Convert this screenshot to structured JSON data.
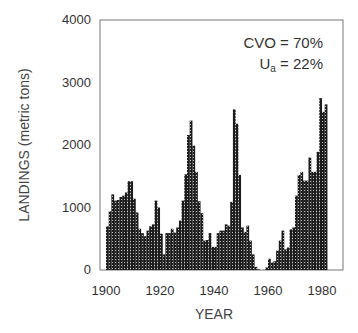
{
  "chart_data": {
    "type": "bar",
    "title": "",
    "xlabel": "YEAR",
    "ylabel": "LANDINGS (metric tons)",
    "xlim": [
      1900,
      1988
    ],
    "ylim": [
      0,
      4000
    ],
    "x_ticks": [
      "1900",
      "1920",
      "1940",
      "1960",
      "1980"
    ],
    "y_ticks": [
      "0",
      "1000",
      "2000",
      "3000",
      "4000"
    ],
    "grid": false,
    "legend": null,
    "annotations": [
      "CVO = 70%",
      "Ua = 22%"
    ],
    "x": [
      1900,
      1901,
      1902,
      1903,
      1904,
      1905,
      1906,
      1907,
      1908,
      1909,
      1910,
      1911,
      1912,
      1913,
      1914,
      1915,
      1916,
      1917,
      1918,
      1919,
      1920,
      1921,
      1922,
      1923,
      1924,
      1925,
      1926,
      1927,
      1928,
      1929,
      1930,
      1931,
      1932,
      1933,
      1934,
      1935,
      1936,
      1937,
      1938,
      1939,
      1940,
      1941,
      1942,
      1943,
      1944,
      1945,
      1946,
      1947,
      1948,
      1949,
      1950,
      1951,
      1952,
      1953,
      1954,
      1955,
      1956,
      1957,
      1958,
      1959,
      1960,
      1961,
      1962,
      1963,
      1964,
      1965,
      1966,
      1967,
      1968,
      1969,
      1970,
      1971,
      1972,
      1973,
      1974,
      1975,
      1976,
      1977,
      1978,
      1979,
      1980,
      1981
    ],
    "values": [
      700,
      940,
      1210,
      1110,
      1120,
      1170,
      1190,
      1240,
      1420,
      1420,
      1140,
      920,
      660,
      590,
      540,
      630,
      700,
      730,
      1110,
      1000,
      580,
      250,
      590,
      590,
      660,
      600,
      680,
      790,
      1110,
      1530,
      2160,
      2390,
      1990,
      1570,
      1100,
      910,
      470,
      480,
      590,
      370,
      370,
      590,
      630,
      630,
      730,
      710,
      1090,
      2570,
      2340,
      1520,
      680,
      610,
      710,
      470,
      250,
      50,
      10,
      0,
      0,
      40,
      180,
      120,
      140,
      310,
      470,
      630,
      330,
      360,
      650,
      680,
      1190,
      1520,
      1570,
      1430,
      1430,
      1800,
      1570,
      1570,
      1890,
      2750,
      2530,
      2650
    ]
  },
  "labels": {
    "xlabel": "YEAR",
    "ylabel": "LANDINGS (metric tons)",
    "annot_cvo": "CVO = 70%",
    "annot_ua_main": "U",
    "annot_ua_sub": "a",
    "annot_ua_rest": " = 22%",
    "x_ticks": [
      "1900",
      "1920",
      "1940",
      "1960",
      "1980"
    ],
    "y_ticks": [
      "0",
      "1000",
      "2000",
      "3000",
      "4000"
    ]
  }
}
